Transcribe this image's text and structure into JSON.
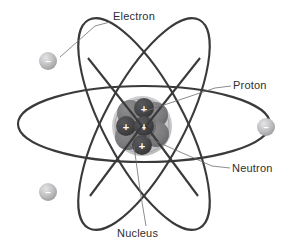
{
  "figure": {
    "background_color": "#ffffff"
  },
  "colors": {
    "orbit_stroke": "#3a3a3c",
    "leader_line": "#6e6e72",
    "label_text": "#2e2e30",
    "proton_fill": "#4a4a4d",
    "proton_fill_dark": "#3c3c3f",
    "neutron_fill": "#7d7d80",
    "nucleus_halo": "#c9c9cb",
    "electron_fill": "#b5b5b7",
    "electron_highlight": "#dcdcde",
    "sign_color": "#ffffff"
  },
  "labels": [
    {
      "id": "electron",
      "text": "Electron",
      "x": 113,
      "y": 20,
      "anchor": "start",
      "leader": [
        [
          110,
          22
        ],
        [
          95,
          26
        ],
        [
          60,
          57
        ]
      ]
    },
    {
      "id": "proton",
      "text": "Proton",
      "x": 233,
      "y": 89,
      "anchor": "start",
      "leader": [
        [
          231,
          86
        ],
        [
          215,
          88
        ],
        [
          143,
          112
        ]
      ]
    },
    {
      "id": "neutron",
      "text": "Neutron",
      "x": 232,
      "y": 172,
      "anchor": "start",
      "leader": [
        [
          230,
          168
        ],
        [
          212,
          166
        ],
        [
          146,
          137
        ]
      ]
    },
    {
      "id": "nucleus",
      "text": "Nucleus",
      "x": 117,
      "y": 237,
      "anchor": "start",
      "leader": [
        [
          146,
          226
        ],
        [
          140,
          190
        ],
        [
          134,
          146
        ]
      ]
    }
  ],
  "orbits": [
    {
      "id": "orbit-horizontal",
      "cx": 144,
      "cy": 124,
      "rx": 126,
      "ry": 38,
      "rotation": 0
    },
    {
      "id": "orbit-tilt-right",
      "cx": 144,
      "cy": 124,
      "rx": 118,
      "ry": 40,
      "rotation": 62
    },
    {
      "id": "orbit-tilt-left",
      "cx": 144,
      "cy": 124,
      "rx": 118,
      "ry": 40,
      "rotation": -62
    }
  ],
  "electrons": [
    {
      "id": "electron-top-left",
      "cx": 48,
      "cy": 61,
      "r": 9,
      "sign": "–"
    },
    {
      "id": "electron-right",
      "cx": 266,
      "cy": 127,
      "r": 9,
      "sign": "–"
    },
    {
      "id": "electron-bottom-left",
      "cx": 48,
      "cy": 192,
      "r": 9,
      "sign": "–"
    }
  ],
  "nucleus": {
    "cx": 142,
    "cy": 126,
    "halo_radius": 30,
    "halo_inner_radius": 27,
    "neutrons": [
      {
        "id": "neutron-upper-left",
        "cx": 130,
        "cy": 113,
        "r": 13
      },
      {
        "id": "neutron-upper-right",
        "cx": 155,
        "cy": 115,
        "r": 13
      },
      {
        "id": "neutron-lower-left",
        "cx": 128,
        "cy": 137,
        "r": 13
      },
      {
        "id": "neutron-lower-right",
        "cx": 156,
        "cy": 134,
        "r": 13
      },
      {
        "id": "neutron-center-back",
        "cx": 143,
        "cy": 126,
        "r": 13
      }
    ],
    "protons": [
      {
        "id": "proton-top",
        "cx": 144,
        "cy": 108,
        "r": 10,
        "sign": "+"
      },
      {
        "id": "proton-left",
        "cx": 126,
        "cy": 126,
        "r": 10,
        "sign": "+"
      },
      {
        "id": "proton-center",
        "cx": 144,
        "cy": 126,
        "r": 10,
        "sign": "+"
      },
      {
        "id": "proton-bottom",
        "cx": 142,
        "cy": 145,
        "r": 10,
        "sign": "+"
      }
    ]
  }
}
